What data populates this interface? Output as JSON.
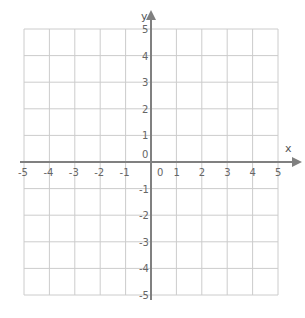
{
  "diagram": {
    "type": "coordinate-grid",
    "x_axis": {
      "label": "x",
      "min": -5,
      "max": 5,
      "ticks": [
        "-5",
        "-4",
        "-3",
        "-2",
        "-1",
        "0",
        "1",
        "2",
        "3",
        "4",
        "5"
      ]
    },
    "y_axis": {
      "label": "y",
      "min": -5,
      "max": 5,
      "ticks": [
        "5",
        "4",
        "3",
        "2",
        "1",
        "0",
        "-1",
        "-2",
        "-3",
        "-4",
        "-5"
      ]
    },
    "colors": {
      "grid": "#cccccc",
      "axis": "#808080",
      "text": "#666666"
    }
  }
}
